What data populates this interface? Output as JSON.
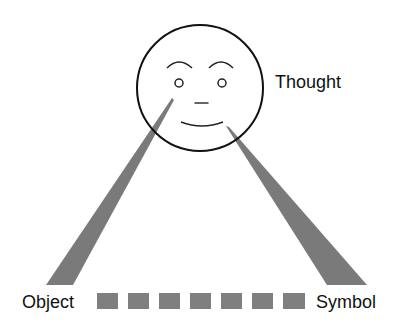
{
  "diagram": {
    "labels": {
      "thought": "Thought",
      "object": "Object",
      "symbol": "Symbol"
    },
    "nodes": [
      {
        "id": "thought",
        "shape": "face-circle"
      },
      {
        "id": "object",
        "shape": "text"
      },
      {
        "id": "symbol",
        "shape": "text"
      }
    ],
    "edges": [
      {
        "from": "thought",
        "to": "object",
        "style": "tapered-beam"
      },
      {
        "from": "thought",
        "to": "symbol",
        "style": "tapered-beam"
      },
      {
        "from": "object",
        "to": "symbol",
        "style": "dashed-blocks",
        "block_count": 7
      }
    ],
    "colors": {
      "outline": "#111111",
      "beam": "#7a7a7a",
      "blocks": "#7f7f7f",
      "background": "#ffffff"
    }
  }
}
